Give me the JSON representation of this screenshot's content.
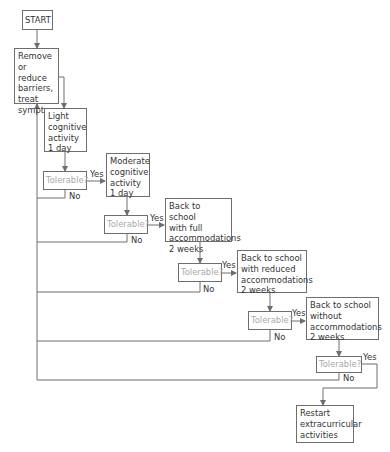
{
  "diagram": {
    "type": "flowchart",
    "colors": {
      "line": "#6e6e6e",
      "text": "#333333",
      "decision_text": "#a9a9a9"
    },
    "nodes": {
      "start": {
        "label": "START"
      },
      "remove": {
        "label": "Remove or\nreduce\nbarriers,\ntreat\nsymptoms"
      },
      "light": {
        "label": "Light\ncognitive\nactivity\n1 day"
      },
      "tol1": {
        "label": "Tolerable?"
      },
      "moderate": {
        "label": "Moderate\ncognitive\nactivity\n1 day"
      },
      "tol2": {
        "label": "Tolerable?"
      },
      "full": {
        "label": "Back to school\nwith full\naccommodations\n2 weeks"
      },
      "tol3": {
        "label": "Tolerable?"
      },
      "reduced": {
        "label": "Back to school\nwith reduced\naccommodations\n2 weeks"
      },
      "tol4": {
        "label": "Tolerable?"
      },
      "without": {
        "label": "Back to school\nwithout\naccommodations\n2 weeks"
      },
      "tol5": {
        "label": "Tolerable?"
      },
      "restart": {
        "label": "Restart\nextracurricular\nactivities"
      }
    },
    "edge_labels": {
      "yes": "Yes",
      "no": "No"
    },
    "edges": [
      {
        "from": "start",
        "to": "remove"
      },
      {
        "from": "remove",
        "to": "light"
      },
      {
        "from": "light",
        "to": "tol1"
      },
      {
        "from": "tol1",
        "to": "moderate",
        "label": "Yes"
      },
      {
        "from": "tol1",
        "to": "remove",
        "label": "No"
      },
      {
        "from": "moderate",
        "to": "tol2"
      },
      {
        "from": "tol2",
        "to": "full",
        "label": "Yes"
      },
      {
        "from": "tol2",
        "to": "remove",
        "label": "No"
      },
      {
        "from": "full",
        "to": "tol3"
      },
      {
        "from": "tol3",
        "to": "reduced",
        "label": "Yes"
      },
      {
        "from": "tol3",
        "to": "remove",
        "label": "No"
      },
      {
        "from": "reduced",
        "to": "tol4"
      },
      {
        "from": "tol4",
        "to": "without",
        "label": "Yes"
      },
      {
        "from": "tol4",
        "to": "remove",
        "label": "No"
      },
      {
        "from": "without",
        "to": "tol5"
      },
      {
        "from": "tol5",
        "to": "restart",
        "label": "Yes"
      },
      {
        "from": "tol5",
        "to": "remove",
        "label": "No"
      }
    ]
  }
}
